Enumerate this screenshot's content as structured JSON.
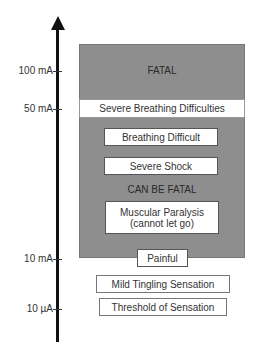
{
  "diagram": {
    "title": "",
    "axis": {
      "direction": "up",
      "ticks": [
        {
          "label": "100 mA",
          "y": 71
        },
        {
          "label": "50 mA",
          "y": 109
        },
        {
          "label": "10 mA",
          "y": 259
        },
        {
          "label": "10 µA",
          "y": 309
        }
      ]
    },
    "regions": {
      "fatal_label": "FATAL",
      "can_be_fatal_label": "CAN BE FATAL"
    },
    "boxes": {
      "severe_breathing": "Severe Breathing Difficulties",
      "breathing_difficult": "Breathing Difficult",
      "severe_shock": "Severe Shock",
      "muscular_paralysis_line1": "Muscular Paralysis",
      "muscular_paralysis_line2": "(cannot let go)",
      "painful": "Painful",
      "mild_tingling": "Mild Tingling Sensation",
      "threshold": "Threshold of Sensation"
    },
    "colors": {
      "danger_region": "#8e8e8e",
      "box_fill": "#ffffff",
      "axis": "#111111"
    }
  }
}
